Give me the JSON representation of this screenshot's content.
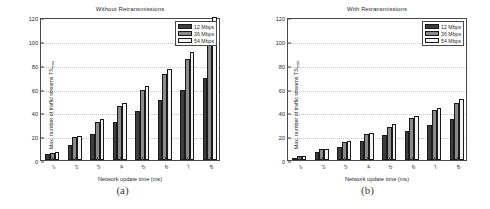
{
  "figure": {
    "panels": [
      {
        "caption": "(a)",
        "title": "Without Retransmissions"
      },
      {
        "caption": "(b)",
        "title": "With Retransmissions"
      }
    ]
  },
  "axis": {
    "ylabel_main": "Max. number of traffic streams TS",
    "ylabel_sub": "max",
    "xlabel": "Network update time (ms)",
    "yticks": [
      "0",
      "20",
      "40",
      "60",
      "80",
      "100",
      "120"
    ],
    "xticks": [
      "1",
      "2",
      "3",
      "4",
      "5",
      "6",
      "7",
      "8"
    ]
  },
  "legend": {
    "items": [
      {
        "label": "12 Mbps",
        "color": "#3d3d3d"
      },
      {
        "label": "36 Mbps",
        "color": "#8a8a8a"
      },
      {
        "label": "54 Mbps",
        "color": "#f2f2f2"
      }
    ]
  },
  "chart_data": [
    {
      "type": "bar",
      "title": "Without Retransmissions",
      "subfigure": "(a)",
      "xlabel": "Network update time (ms)",
      "ylabel": "Max. number of traffic streams TS_max",
      "categories": [
        "1",
        "2",
        "3",
        "4",
        "5",
        "6",
        "7",
        "8"
      ],
      "ylim": [
        0,
        120
      ],
      "yticks": [
        0,
        20,
        40,
        60,
        80,
        100,
        120
      ],
      "grid": true,
      "legend_position": "top-right",
      "series": [
        {
          "name": "12 Mbps",
          "color": "#3d3d3d",
          "values": [
            5,
            13,
            22,
            32,
            41,
            50,
            59,
            69
          ]
        },
        {
          "name": "36 Mbps",
          "color": "#8a8a8a",
          "values": [
            6,
            19,
            32,
            45,
            59,
            72,
            85,
            98
          ]
        },
        {
          "name": "54 Mbps",
          "color": "#f2f2f2",
          "values": [
            7,
            20,
            34,
            48,
            62,
            76,
            91,
            120
          ]
        }
      ]
    },
    {
      "type": "bar",
      "title": "With Retransmissions",
      "subfigure": "(b)",
      "xlabel": "Network update time (ms)",
      "ylabel": "Max. number of traffic streams TS_max",
      "categories": [
        "1",
        "2",
        "3",
        "4",
        "5",
        "6",
        "7",
        "8"
      ],
      "ylim": [
        0,
        120
      ],
      "yticks": [
        0,
        20,
        40,
        60,
        80,
        100,
        120
      ],
      "grid": true,
      "legend_position": "top-right",
      "series": [
        {
          "name": "12 Mbps",
          "color": "#3d3d3d",
          "values": [
            2,
            7,
            11,
            16,
            21,
            24,
            29,
            34
          ]
        },
        {
          "name": "36 Mbps",
          "color": "#8a8a8a",
          "values": [
            3,
            9,
            15,
            22,
            28,
            35,
            42,
            48
          ]
        },
        {
          "name": "54 Mbps",
          "color": "#f2f2f2",
          "values": [
            3,
            9,
            16,
            23,
            30,
            37,
            44,
            51
          ]
        }
      ]
    }
  ]
}
